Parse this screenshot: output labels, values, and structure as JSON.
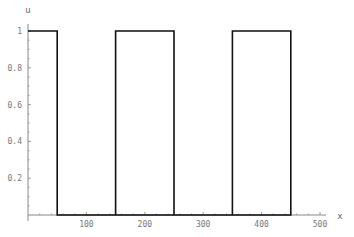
{
  "chart_data": {
    "type": "line",
    "title": "",
    "xlabel": "x",
    "ylabel": "u",
    "xlim": [
      0,
      500
    ],
    "ylim": [
      0,
      1
    ],
    "x_ticks": [
      100,
      200,
      300,
      400,
      500
    ],
    "x_tick_labels": [
      "100",
      "200",
      "300",
      "400",
      "500"
    ],
    "y_ticks": [
      0.2,
      0.4,
      0.6,
      0.8,
      1
    ],
    "y_tick_labels": [
      "0.2",
      "0.4",
      "0.6",
      "0.8",
      "1"
    ],
    "grid": false,
    "legend": null,
    "series": [
      {
        "name": "u(x)",
        "points": [
          [
            0,
            1
          ],
          [
            50,
            1
          ],
          [
            50,
            0
          ],
          [
            150,
            0
          ],
          [
            150,
            1
          ],
          [
            250,
            1
          ],
          [
            250,
            0
          ],
          [
            350,
            0
          ],
          [
            350,
            1
          ],
          [
            450,
            1
          ],
          [
            450,
            0
          ],
          [
            50,
            0
          ]
        ],
        "note": "Top edge at u=1 from x=0 to 450; bottom edge at u=0 from x=50 to 450; vertical segments at x=50,150,250,350,450"
      }
    ],
    "colors": {
      "line": "#111111",
      "axis": "#888888",
      "text": "#777777"
    }
  }
}
